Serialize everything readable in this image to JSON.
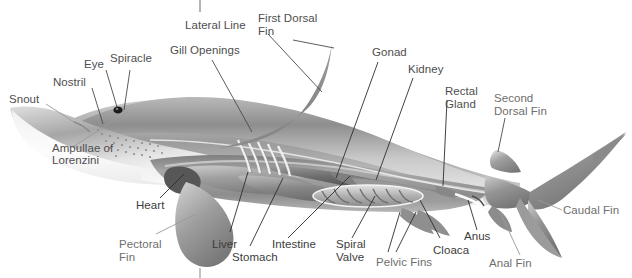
{
  "figure": {
    "type": "anatomical-diagram",
    "view": "lateral-left-side",
    "background_color": "#ffffff",
    "label_color": "#4e4e4e",
    "label_color_light": "#6e6e6e",
    "leader_line_color": "#3a3a3a",
    "leader_line_color_light": "#8a8a8a",
    "body_fill_dark": "#6e6e6e",
    "body_fill_mid": "#9a9a9a",
    "body_fill_light": "#d4d4d4",
    "belly_fill": "#fdfdfd"
  },
  "labels": {
    "snout": "Snout",
    "nostril": "Nostril",
    "eye": "Eye",
    "spiracle": "Spiracle",
    "ampullae_line1": "Ampullae of",
    "ampullae_line2": "Lorenzini",
    "gill_openings": "Gill Openings",
    "lateral_line": "Lateral Line",
    "first_dorsal_line1": "First Dorsal",
    "first_dorsal_line2": "Fin",
    "gonad": "Gonad",
    "kidney": "Kidney",
    "rectal_line1": "Rectal",
    "rectal_line2": "Gland",
    "second_dorsal_line1": "Second",
    "second_dorsal_line2": "Dorsal Fin",
    "caudal_fin": "Caudal Fin",
    "anal_fin": "Anal Fin",
    "anus": "Anus",
    "cloaca": "Cloaca",
    "pelvic_fins": "Pelvic Fins",
    "spiral_line1": "Spiral",
    "spiral_line2": "Valve",
    "intestine": "Intestine",
    "stomach": "Stomach",
    "liver": "Liver",
    "pectoral_line1": "Pectoral",
    "pectoral_line2": "Fin",
    "heart": "Heart"
  },
  "parts": [
    {
      "name": "Snout",
      "group": "external-head"
    },
    {
      "name": "Nostril",
      "group": "external-head"
    },
    {
      "name": "Eye",
      "group": "external-head"
    },
    {
      "name": "Spiracle",
      "group": "external-head"
    },
    {
      "name": "Ampullae of Lorenzini",
      "group": "external-head"
    },
    {
      "name": "Gill Openings",
      "group": "external-head"
    },
    {
      "name": "Lateral Line",
      "group": "external-body"
    },
    {
      "name": "First Dorsal Fin",
      "group": "fins"
    },
    {
      "name": "Second Dorsal Fin",
      "group": "fins"
    },
    {
      "name": "Caudal Fin",
      "group": "fins"
    },
    {
      "name": "Anal Fin",
      "group": "fins"
    },
    {
      "name": "Pelvic Fins",
      "group": "fins"
    },
    {
      "name": "Pectoral Fin",
      "group": "fins"
    },
    {
      "name": "Gonad",
      "group": "internal"
    },
    {
      "name": "Kidney",
      "group": "internal"
    },
    {
      "name": "Rectal Gland",
      "group": "internal"
    },
    {
      "name": "Anus",
      "group": "internal"
    },
    {
      "name": "Cloaca",
      "group": "internal"
    },
    {
      "name": "Spiral Valve",
      "group": "internal"
    },
    {
      "name": "Intestine",
      "group": "internal"
    },
    {
      "name": "Stomach",
      "group": "internal"
    },
    {
      "name": "Liver",
      "group": "internal"
    },
    {
      "name": "Heart",
      "group": "internal"
    }
  ]
}
